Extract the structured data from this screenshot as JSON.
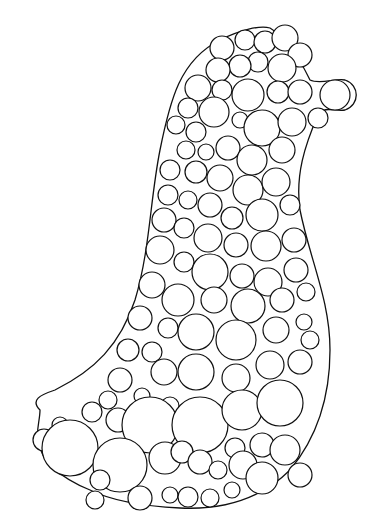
{
  "image": {
    "subject": "hand-drawn circle packing in bird-like silhouette",
    "background": "#ffffff",
    "stroke": "#111111",
    "width": 376,
    "height": 531
  },
  "outline_path": "M 40 410 C 30 400 40 395 55 390 C 95 370 120 345 135 300 C 150 250 150 200 160 150 C 170 100 180 60 220 40 C 240 30 260 25 270 28 C 290 40 300 60 310 80 C 320 85 335 78 345 80 C 360 85 360 105 345 110 C 335 112 325 105 318 115 C 305 145 295 175 300 210 C 310 260 330 300 330 350 C 330 400 315 440 290 470 C 260 500 220 510 180 508 C 140 506 110 500 90 490 C 60 478 40 460 38 440 C 36 430 40 420 40 410 Z",
  "circles": [
    [
      222,
      48,
      12
    ],
    [
      245,
      40,
      10
    ],
    [
      265,
      42,
      11
    ],
    [
      285,
      38,
      13
    ],
    [
      300,
      55,
      12
    ],
    [
      258,
      62,
      10
    ],
    [
      240,
      66,
      11
    ],
    [
      218,
      70,
      12
    ],
    [
      282,
      68,
      14
    ],
    [
      198,
      88,
      13
    ],
    [
      222,
      90,
      10
    ],
    [
      248,
      95,
      16
    ],
    [
      278,
      92,
      11
    ],
    [
      300,
      92,
      12
    ],
    [
      335,
      95,
      15
    ],
    [
      188,
      108,
      10
    ],
    [
      214,
      112,
      15
    ],
    [
      240,
      120,
      8
    ],
    [
      262,
      128,
      18
    ],
    [
      292,
      122,
      14
    ],
    [
      318,
      118,
      10
    ],
    [
      176,
      125,
      9
    ],
    [
      196,
      132,
      10
    ],
    [
      186,
      150,
      9
    ],
    [
      206,
      152,
      8
    ],
    [
      228,
      148,
      12
    ],
    [
      252,
      160,
      15
    ],
    [
      282,
      150,
      13
    ],
    [
      170,
      170,
      10
    ],
    [
      196,
      172,
      11
    ],
    [
      220,
      178,
      13
    ],
    [
      248,
      190,
      15
    ],
    [
      276,
      182,
      14
    ],
    [
      168,
      195,
      10
    ],
    [
      188,
      200,
      9
    ],
    [
      210,
      205,
      12
    ],
    [
      232,
      218,
      11
    ],
    [
      262,
      215,
      16
    ],
    [
      290,
      205,
      10
    ],
    [
      164,
      220,
      12
    ],
    [
      184,
      228,
      10
    ],
    [
      208,
      238,
      14
    ],
    [
      236,
      245,
      12
    ],
    [
      266,
      246,
      15
    ],
    [
      294,
      240,
      12
    ],
    [
      160,
      250,
      14
    ],
    [
      184,
      262,
      10
    ],
    [
      210,
      272,
      18
    ],
    [
      242,
      276,
      12
    ],
    [
      268,
      282,
      14
    ],
    [
      296,
      270,
      12
    ],
    [
      152,
      285,
      13
    ],
    [
      178,
      300,
      16
    ],
    [
      214,
      300,
      13
    ],
    [
      248,
      306,
      17
    ],
    [
      282,
      300,
      12
    ],
    [
      306,
      292,
      9
    ],
    [
      140,
      318,
      12
    ],
    [
      168,
      328,
      10
    ],
    [
      196,
      332,
      18
    ],
    [
      236,
      340,
      20
    ],
    [
      276,
      330,
      13
    ],
    [
      304,
      322,
      8
    ],
    [
      310,
      340,
      9
    ],
    [
      128,
      350,
      11
    ],
    [
      152,
      352,
      10
    ],
    [
      164,
      372,
      13
    ],
    [
      196,
      372,
      18
    ],
    [
      236,
      378,
      14
    ],
    [
      270,
      365,
      14
    ],
    [
      300,
      362,
      12
    ],
    [
      120,
      380,
      12
    ],
    [
      142,
      396,
      8
    ],
    [
      170,
      406,
      9
    ],
    [
      108,
      400,
      9
    ],
    [
      92,
      412,
      10
    ],
    [
      118,
      420,
      12
    ],
    [
      150,
      425,
      28
    ],
    [
      200,
      425,
      28
    ],
    [
      242,
      410,
      20
    ],
    [
      280,
      403,
      23
    ],
    [
      60,
      425,
      8
    ],
    [
      44,
      440,
      11
    ],
    [
      70,
      448,
      28
    ],
    [
      120,
      465,
      27
    ],
    [
      165,
      458,
      16
    ],
    [
      182,
      452,
      11
    ],
    [
      200,
      462,
      12
    ],
    [
      218,
      470,
      9
    ],
    [
      235,
      448,
      10
    ],
    [
      243,
      465,
      14
    ],
    [
      262,
      445,
      12
    ],
    [
      262,
      478,
      16
    ],
    [
      285,
      450,
      15
    ],
    [
      300,
      475,
      12
    ],
    [
      140,
      498,
      12
    ],
    [
      170,
      495,
      8
    ],
    [
      188,
      497,
      10
    ],
    [
      210,
      498,
      9
    ],
    [
      232,
      490,
      8
    ],
    [
      100,
      480,
      10
    ],
    [
      95,
      500,
      9
    ]
  ]
}
